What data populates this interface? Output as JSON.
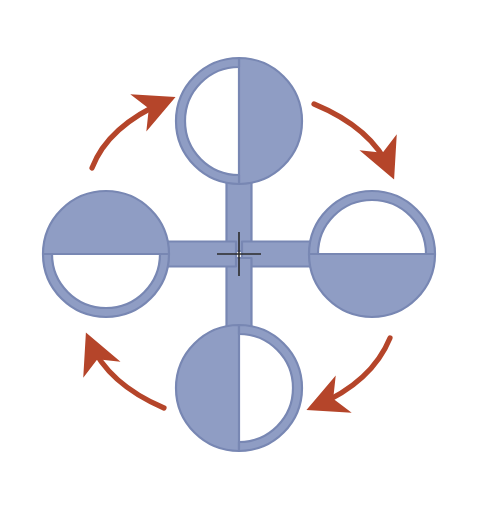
{
  "figure": {
    "name": "four-fold-rotation-diagram",
    "background_color": "#ffffff",
    "width": 478,
    "height": 505,
    "cropped_caption_fragment": ""
  },
  "palette": {
    "shape_blue": "#8f9dc4",
    "shape_blue_outline": "#7887b3",
    "shape_blue_dark": "#6f7fae",
    "arrow_red": "#b5452a",
    "arrow_red_dark": "#9e3a22",
    "cross_black": "#2b2b2b",
    "white": "#ffffff"
  },
  "center_mark": {
    "name": "rotation-axis-cross",
    "label": "+",
    "x": 239,
    "y": 254,
    "arm_length": 22,
    "stroke_width": 1.6,
    "color": "#2b2b2b"
  },
  "shapes": [
    {
      "id": "top",
      "name": "lollipop-top",
      "position_label": "top",
      "rotation_deg": 0,
      "circle_center_x": 239,
      "circle_center_y": 121,
      "circle_radius": 63,
      "ring_thickness": 9,
      "stem_width": 25,
      "stem_length": 72,
      "stem_direction": "down",
      "filled_half": "right",
      "hollow_half": "left",
      "divider_orientation": "vertical"
    },
    {
      "id": "right",
      "name": "lollipop-right",
      "position_label": "right",
      "rotation_deg": 90,
      "circle_center_x": 372,
      "circle_center_y": 254,
      "circle_radius": 63,
      "ring_thickness": 9,
      "stem_width": 25,
      "stem_length": 72,
      "stem_direction": "left",
      "filled_half": "bottom",
      "hollow_half": "top",
      "divider_orientation": "horizontal"
    },
    {
      "id": "bottom",
      "name": "lollipop-bottom",
      "position_label": "bottom",
      "rotation_deg": 180,
      "circle_center_x": 239,
      "circle_center_y": 388,
      "circle_radius": 63,
      "ring_thickness": 9,
      "stem_width": 25,
      "stem_length": 72,
      "stem_direction": "up",
      "filled_half": "left",
      "hollow_half": "right",
      "divider_orientation": "vertical"
    },
    {
      "id": "left",
      "name": "lollipop-left",
      "position_label": "left",
      "rotation_deg": 270,
      "circle_center_x": 106,
      "circle_center_y": 254,
      "circle_radius": 63,
      "ring_thickness": 9,
      "stem_width": 25,
      "stem_length": 72,
      "stem_direction": "right",
      "filled_half": "top",
      "hollow_half": "bottom",
      "divider_orientation": "horizontal"
    }
  ],
  "arrows": [
    {
      "id": "bottom-left-to-top-left",
      "name": "rotation-arrow-upper-left",
      "quadrant": "upper-left",
      "direction": "up-right",
      "points_from": "left",
      "points_to": "top",
      "color": "#b5452a"
    },
    {
      "id": "top-right",
      "name": "rotation-arrow-upper-right",
      "quadrant": "upper-right",
      "direction": "down-right",
      "points_from": "top",
      "points_to": "right",
      "color": "#b5452a"
    },
    {
      "id": "bottom-right",
      "name": "rotation-arrow-lower-right",
      "quadrant": "lower-right",
      "direction": "down-left",
      "points_from": "right",
      "points_to": "bottom",
      "color": "#b5452a"
    },
    {
      "id": "bottom-left",
      "name": "rotation-arrow-lower-left",
      "quadrant": "lower-left",
      "direction": "up-left",
      "points_from": "bottom",
      "points_to": "left",
      "color": "#b5452a"
    }
  ],
  "rotation": {
    "sense": "clockwise",
    "order": 4,
    "step_deg": 90
  }
}
